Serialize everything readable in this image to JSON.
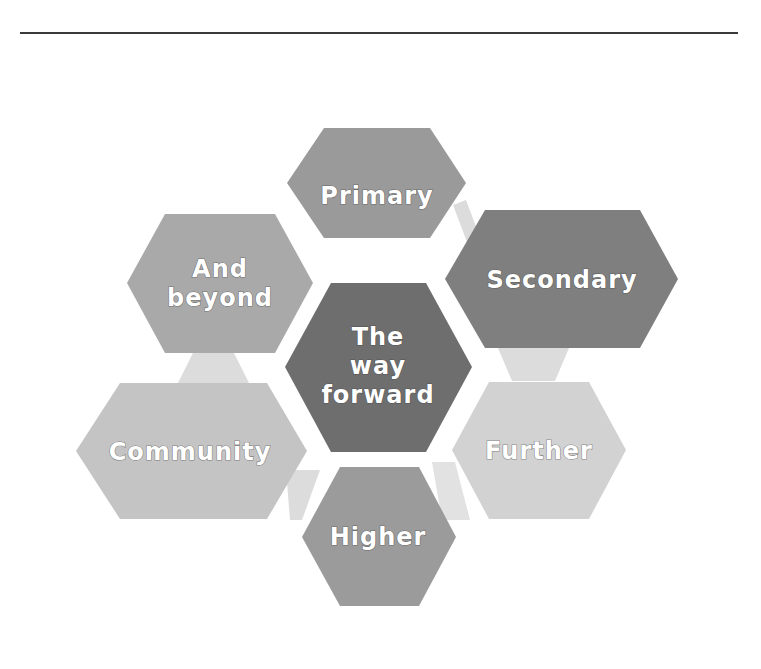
{
  "header": {
    "rule": "horizontal-divider"
  },
  "diagram": {
    "type": "hexagon-cluster",
    "center": {
      "label_lines": [
        "The",
        "way",
        "forward"
      ],
      "color": "#6e6e6e"
    },
    "nodes": [
      {
        "id": "primary",
        "label_lines": [
          "Primary"
        ],
        "color": "#9a9a9a"
      },
      {
        "id": "secondary",
        "label_lines": [
          "Secondary"
        ],
        "color": "#7f7f7f"
      },
      {
        "id": "further",
        "label_lines": [
          "Further"
        ],
        "color": "#d2d2d2"
      },
      {
        "id": "higher",
        "label_lines": [
          "Higher"
        ],
        "color": "#9b9b9b"
      },
      {
        "id": "community",
        "label_lines": [
          "Community"
        ],
        "color": "#c4c4c4"
      },
      {
        "id": "and-beyond",
        "label_lines": [
          "And",
          "beyond"
        ],
        "color": "#a9a9a9"
      }
    ],
    "connector_color": "#dcdcdc"
  }
}
